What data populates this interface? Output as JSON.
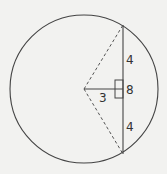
{
  "diagram": {
    "type": "circle-chord-geometry",
    "colors": {
      "background": "#f2f2f0",
      "stroke": "#444444",
      "text": "#333333"
    },
    "circle": {
      "cx": 84,
      "cy": 89,
      "r": 74
    },
    "chord": {
      "x": 123,
      "y1": 25,
      "y2": 154,
      "style": "solid"
    },
    "radii": [
      {
        "from": [
          84,
          89
        ],
        "to": [
          123,
          25
        ],
        "style": "dashed"
      },
      {
        "from": [
          84,
          89
        ],
        "to": [
          123,
          154
        ],
        "style": "dashed"
      }
    ],
    "perpendicular": {
      "from": [
        84,
        89
      ],
      "to": [
        123,
        89
      ],
      "style": "solid"
    },
    "right_angle_box": {
      "x": 115,
      "y": 80,
      "w": 8,
      "h": 18
    },
    "labels": {
      "upper_half": "4",
      "chord_length": "8",
      "distance": "3",
      "lower_half": "4"
    }
  }
}
